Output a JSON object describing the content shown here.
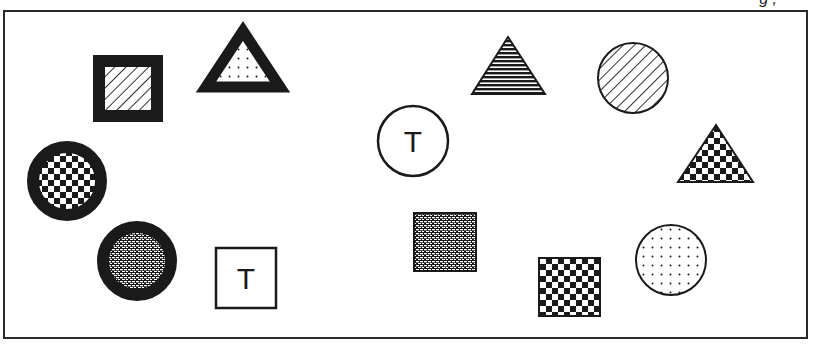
{
  "figure": {
    "caption_fragment": "g ,",
    "frame_color": "#2a2a2a",
    "ink_color": "#1a1a1a",
    "background": "#ffffff"
  },
  "shapes": [
    {
      "id": "square-hatched-thick",
      "type": "square",
      "fill": "diagonal-hatch",
      "border": "thick",
      "label": ""
    },
    {
      "id": "triangle-dotted-thick",
      "type": "triangle",
      "fill": "dots",
      "border": "thick",
      "label": ""
    },
    {
      "id": "triangle-horizontal-lines",
      "type": "triangle",
      "fill": "horizontal-lines",
      "border": "thin",
      "label": ""
    },
    {
      "id": "circle-hatched",
      "type": "circle",
      "fill": "diagonal-hatch",
      "border": "thin",
      "label": ""
    },
    {
      "id": "circle-t",
      "type": "circle",
      "fill": "none",
      "border": "thin",
      "label": "T"
    },
    {
      "id": "triangle-checkered",
      "type": "triangle",
      "fill": "checker",
      "border": "thin",
      "label": ""
    },
    {
      "id": "circle-checkered-thick",
      "type": "circle",
      "fill": "checker",
      "border": "thick",
      "label": ""
    },
    {
      "id": "circle-brick-thick",
      "type": "circle",
      "fill": "brick",
      "border": "thick",
      "label": ""
    },
    {
      "id": "square-t",
      "type": "square",
      "fill": "none",
      "border": "thin",
      "label": "T"
    },
    {
      "id": "square-brick",
      "type": "square",
      "fill": "brick",
      "border": "thin",
      "label": ""
    },
    {
      "id": "square-checkered",
      "type": "square",
      "fill": "checker",
      "border": "thin",
      "label": ""
    },
    {
      "id": "circle-dotted",
      "type": "circle",
      "fill": "dots",
      "border": "thin",
      "label": ""
    }
  ],
  "labels": {
    "circle_t": "T",
    "square_t": "T"
  }
}
